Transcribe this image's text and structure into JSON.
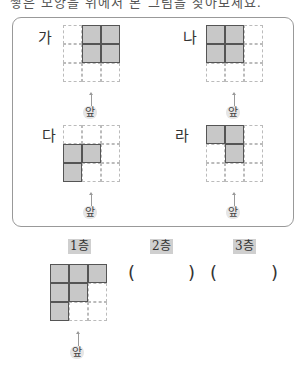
{
  "question_cutoff": "쌓은 모양을 위에서 본 그림을 찾아보세요.",
  "options": [
    {
      "label": "가",
      "filled": [
        [
          0,
          1
        ],
        [
          0,
          2
        ],
        [
          1,
          1
        ],
        [
          1,
          2
        ]
      ]
    },
    {
      "label": "나",
      "filled": [
        [
          0,
          0
        ],
        [
          0,
          1
        ],
        [
          1,
          0
        ],
        [
          1,
          1
        ]
      ]
    },
    {
      "label": "다",
      "filled": [
        [
          1,
          0
        ],
        [
          1,
          1
        ],
        [
          2,
          0
        ]
      ]
    },
    {
      "label": "라",
      "filled": [
        [
          0,
          0
        ],
        [
          0,
          1
        ],
        [
          1,
          1
        ]
      ]
    }
  ],
  "front_label": "앞",
  "floors": [
    {
      "label": "1층",
      "filled": [
        [
          0,
          0
        ],
        [
          0,
          1
        ],
        [
          0,
          2
        ],
        [
          1,
          0
        ],
        [
          1,
          1
        ],
        [
          2,
          0
        ]
      ]
    },
    {
      "label": "2층",
      "answer": ""
    },
    {
      "label": "3층",
      "answer": ""
    }
  ],
  "paren_open": "(",
  "paren_close": ")"
}
